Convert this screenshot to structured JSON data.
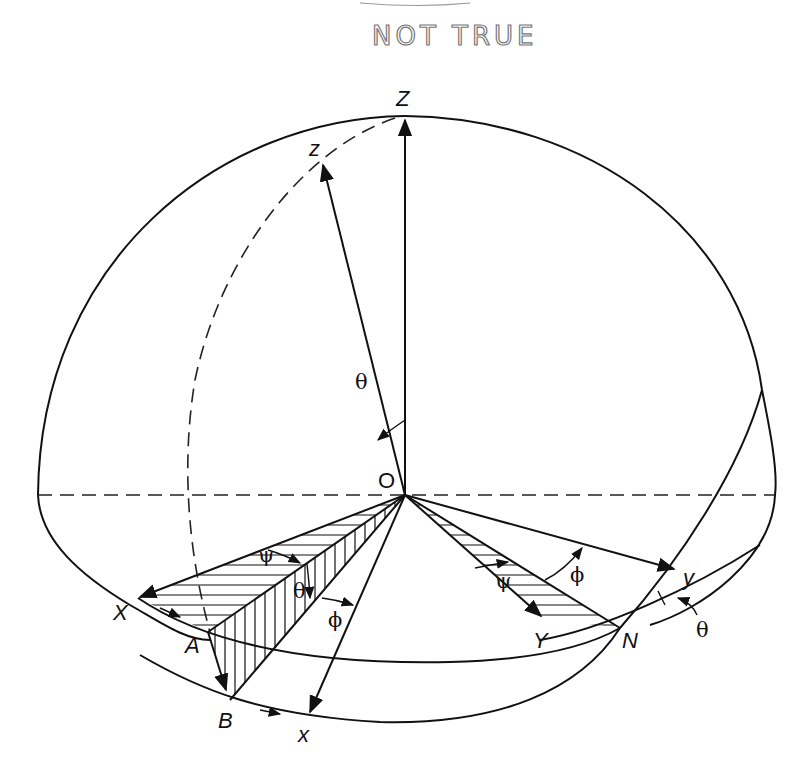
{
  "annotation": {
    "text": "NOT TRUE",
    "style": "handwritten",
    "color": "#777777"
  },
  "diagram": {
    "origin_label": "O",
    "fixed_axes": {
      "X": "X",
      "Y": "Y",
      "Z": "Z"
    },
    "body_axes": {
      "x": "x",
      "y": "y",
      "z": "z"
    },
    "points": {
      "A": "A",
      "B": "B",
      "N": "N"
    },
    "angles": {
      "theta_top": "θ",
      "psi_left": "ψ",
      "theta_left": "θ",
      "phi_left": "ϕ",
      "psi_right": "ψ",
      "phi_right": "ϕ",
      "theta_right": "θ"
    },
    "line_color": "#111111",
    "hatch_regions": [
      "X-O-A (horizontal hatch)",
      "A-O-B (vertical hatch)",
      "O-Y-N (horizontal hatch)"
    ]
  }
}
